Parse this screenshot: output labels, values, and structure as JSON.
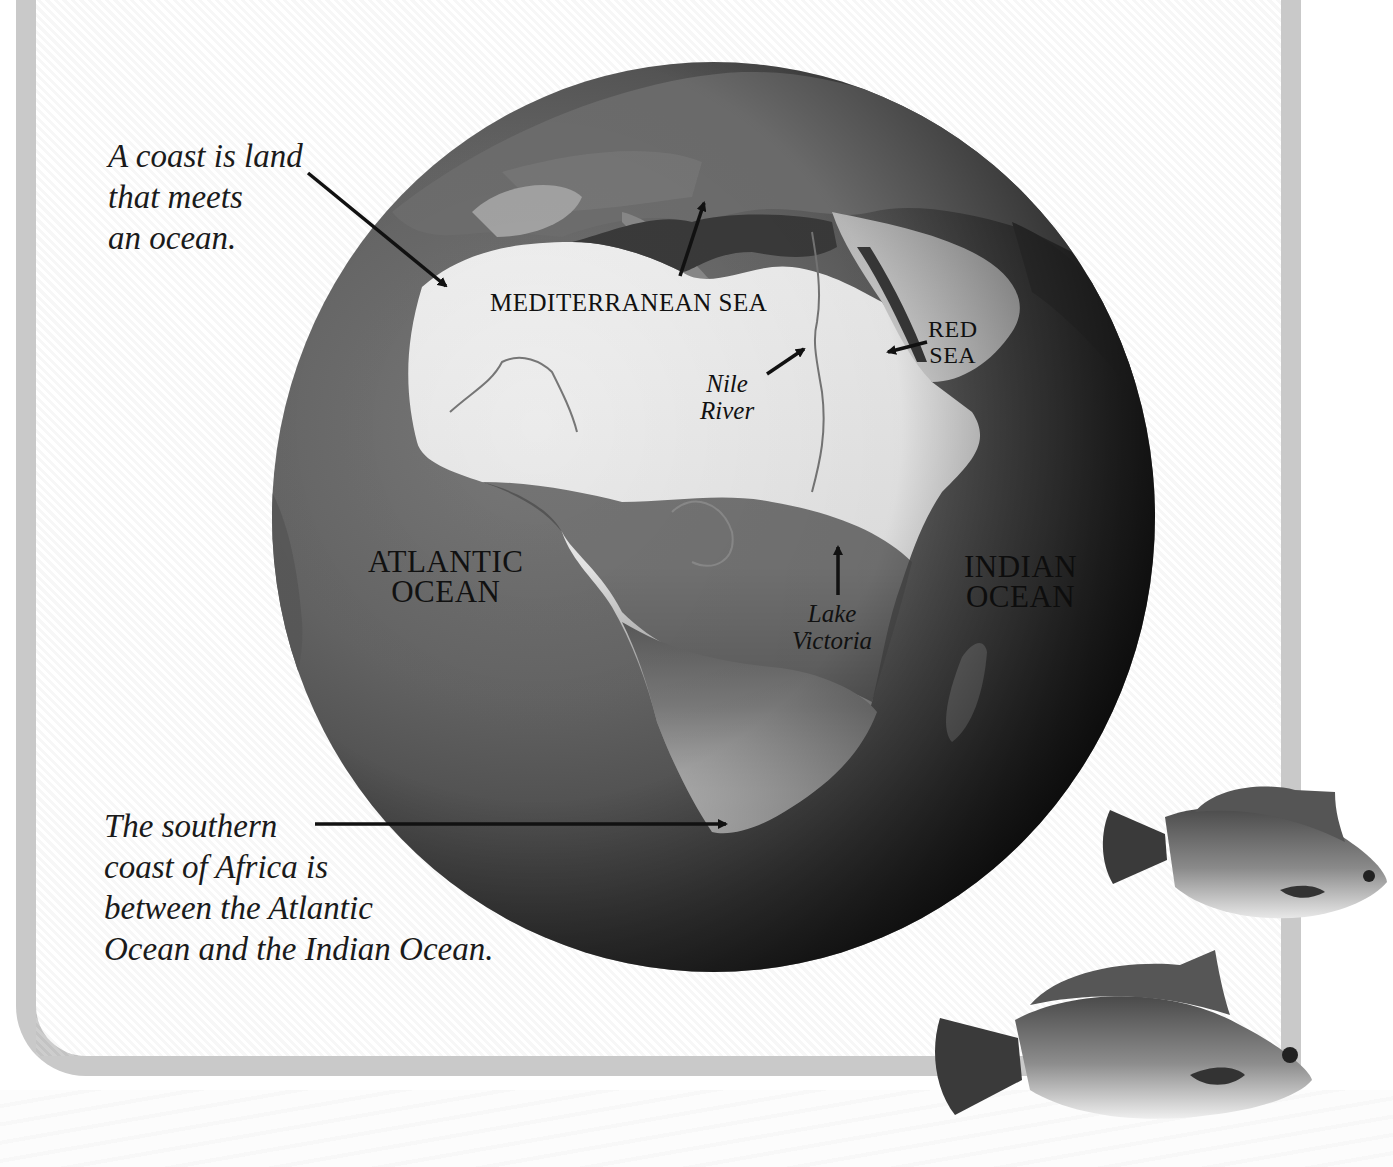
{
  "page": {
    "frame_color": "#c9c9c9",
    "background": "#ffffff"
  },
  "captions": {
    "coast": {
      "lines": [
        "A coast is land",
        "that meets",
        "an ocean."
      ]
    },
    "southern_coast": {
      "lines": [
        "The southern",
        "coast of Africa is",
        "between the Atlantic",
        "Ocean and the Indian Ocean."
      ]
    }
  },
  "map_labels": {
    "mediterranean": "MEDITERRANEAN SEA",
    "red_sea": [
      "RED",
      "SEA"
    ],
    "nile": [
      "Nile",
      "River"
    ],
    "atlantic": [
      "ATLANTIC",
      "OCEAN"
    ],
    "indian": [
      "INDIAN",
      "OCEAN"
    ],
    "lake_victoria": [
      "Lake",
      "Victoria"
    ]
  },
  "illustrations": {
    "globe": "globe-africa-satellite",
    "fish": [
      "fish-illustration-upper",
      "fish-illustration-lower"
    ]
  }
}
